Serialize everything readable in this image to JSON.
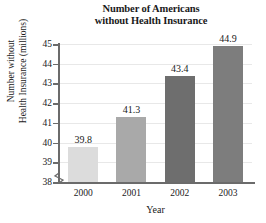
{
  "chart_data": {
    "type": "bar",
    "title": "Number of Americans without Health Insurance",
    "title_lines": [
      "Number of Americans",
      "without Health Insurance"
    ],
    "xlabel": "Year",
    "ylabel": "Number without Health Insurance (millions)",
    "ylabel_lines": [
      "Number without",
      "Health Insurance (millions)"
    ],
    "categories": [
      "2000",
      "2001",
      "2002",
      "2003"
    ],
    "values": [
      39.8,
      41.3,
      43.4,
      44.9
    ],
    "value_labels": [
      "39.8",
      "41.3",
      "43.4",
      "44.9"
    ],
    "ylim": [
      38,
      45
    ],
    "yticks": [
      38,
      39,
      40,
      41,
      42,
      43,
      44,
      45
    ],
    "ytick_labels": [
      "38",
      "39",
      "40",
      "41",
      "42",
      "43",
      "44",
      "45"
    ],
    "axis_break": true,
    "grid": true,
    "grid_axis": "y",
    "legend": "none",
    "bar_colors": [
      "#dcdcdc",
      "#a9a9a9",
      "#6e6e6e",
      "#7d7d7d"
    ],
    "bar_border_color": "#8c8c8c",
    "axis_color": "#6b6b6b",
    "gridline_color": "#e8e8e8",
    "text_color": "#1a1a1a"
  }
}
